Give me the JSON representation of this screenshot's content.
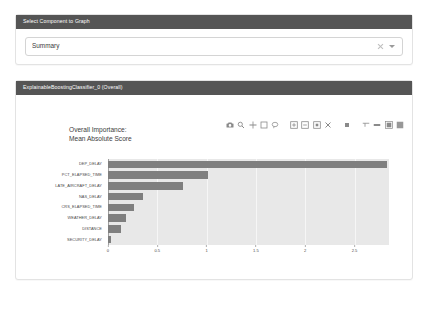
{
  "selector_panel": {
    "header": "Select Component to Graph",
    "select": {
      "value": "Summary",
      "placeholder": "Select...",
      "clear_icon": "close-icon",
      "caret_icon": "chevron-down-icon"
    }
  },
  "graph_panel": {
    "header": "ExplainableBoostingClassifier_0 (Overall)",
    "modebar": [
      {
        "name": "download-plot-icon",
        "title": "Download plot as a png"
      },
      {
        "name": "zoom-icon",
        "title": "Zoom"
      },
      {
        "name": "pan-icon",
        "title": "Pan"
      },
      {
        "name": "zoom-box-select-icon",
        "title": "Box Select"
      },
      {
        "name": "lasso-select-icon",
        "title": "Lasso Select"
      },
      {
        "name": "zoom-in-icon",
        "title": "Zoom in"
      },
      {
        "name": "zoom-out-icon",
        "title": "Zoom out"
      },
      {
        "name": "autoscale-icon",
        "title": "Autoscale"
      },
      {
        "name": "reset-axes-icon",
        "title": "Reset axes"
      },
      {
        "name": "toggle-spike-lines-icon",
        "title": "Toggle Spike Lines"
      },
      {
        "name": "hover-compare-icon",
        "title": "Show closest data on hover"
      },
      {
        "name": "hover-closest-icon",
        "title": "Compare data on hover"
      },
      {
        "name": "plotly-logo-icon",
        "title": "Produced with Plotly"
      }
    ]
  },
  "chart_data": {
    "type": "bar",
    "orientation": "horizontal",
    "title": "Overall Importance:\nMean Absolute Score",
    "xlabel": "",
    "ylabel": "",
    "xlim": [
      0,
      2.85
    ],
    "grid": true,
    "legend": "none",
    "xticks": [
      0,
      0.5,
      1,
      1.5,
      2,
      2.5
    ],
    "xtick_labels": [
      "0",
      "0.5",
      "1",
      "1.5",
      "2",
      "2.5"
    ],
    "categories": [
      "DEP_DELAY",
      "PCT_ELAPSED_TIME",
      "LATE_AIRCRAFT_DELAY",
      "NAS_DELAY",
      "CRS_ELAPSED_TIME",
      "WEATHER_DELAY",
      "DISTANCE",
      "SECURITY_DELAY"
    ],
    "values": [
      2.83,
      1.01,
      0.76,
      0.36,
      0.26,
      0.18,
      0.13,
      0.03
    ],
    "bar_color": "#7f7f7f",
    "plot_bgcolor": "#e8e8e8"
  }
}
